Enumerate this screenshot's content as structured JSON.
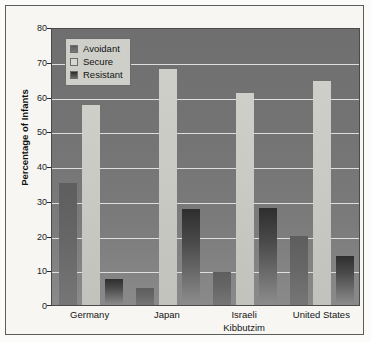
{
  "chart_data": {
    "type": "bar",
    "title": "",
    "xlabel": "",
    "ylabel": "Percentage of Infants",
    "ylim": [
      0,
      80
    ],
    "ytick_step": 10,
    "yticks": [
      "0",
      "10",
      "20",
      "30",
      "40",
      "50",
      "60",
      "70",
      "80"
    ],
    "grid": true,
    "legend_position": "top-left",
    "categories": [
      "Germany",
      "Japan",
      "Israeli Kibbutzim",
      "United States"
    ],
    "category_lines": [
      [
        "Germany"
      ],
      [
        "Japan"
      ],
      [
        "Israeli",
        "Kibbutzim"
      ],
      [
        "United States"
      ]
    ],
    "series": [
      {
        "name": "Avoidant",
        "color": "#6b6b6b",
        "values": [
          35,
          5,
          9.5,
          20
        ]
      },
      {
        "name": "Secure",
        "color": "#c9c9c3",
        "values": [
          57.5,
          68,
          61,
          64.5
        ]
      },
      {
        "name": "Resistant",
        "color": "#3a3a3a",
        "values": [
          7.5,
          27.5,
          28,
          14
        ]
      }
    ]
  },
  "legend": {
    "items": [
      {
        "label": "Avoidant",
        "swatch": "avoidant"
      },
      {
        "label": "Secure",
        "swatch": "secure"
      },
      {
        "label": "Resistant",
        "swatch": "resistant"
      }
    ]
  },
  "colors": {
    "plot_background": "#757575",
    "gridline": "#dedede",
    "page_background": "#f7f6f3",
    "frame_border": "#5d5d5d",
    "text": "#141414"
  }
}
